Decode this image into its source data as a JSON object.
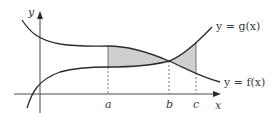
{
  "diagram": {
    "axes": {
      "x_label": "x",
      "y_label": "y"
    },
    "curves": [
      {
        "name": "g",
        "label": "y = g(x)",
        "description": "rising curve, lower on the left, crosses f at b"
      },
      {
        "name": "f",
        "label": "y = f(x)",
        "description": "falling curve, higher on the left, crosses g at b"
      }
    ],
    "points": [
      {
        "name": "a",
        "label": "a"
      },
      {
        "name": "b",
        "label": "b"
      },
      {
        "name": "c",
        "label": "c"
      }
    ],
    "shaded_regions": [
      {
        "from": "a",
        "to": "b",
        "between": [
          "f",
          "g"
        ]
      },
      {
        "from": "b",
        "to": "c",
        "between": [
          "g",
          "f"
        ]
      }
    ],
    "colors": {
      "curve": "#2b2b2b",
      "axis": "#4a4a4a",
      "shade": "#cfcfcf",
      "dashed": "#555555",
      "text": "#3a3a3a"
    }
  }
}
